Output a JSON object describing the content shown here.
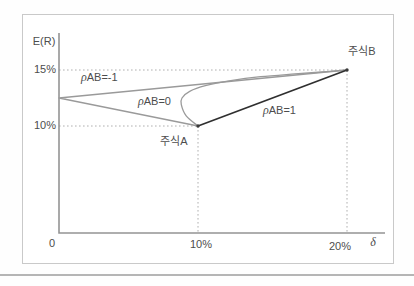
{
  "colors": {
    "axis": "#949494",
    "dotted": "#b0b0b0",
    "text": "#4d4d4d",
    "frame_border": "#c9c9c9",
    "divider": "#b5b5b5",
    "point": "#3a3a3a"
  },
  "chart_data": {
    "type": "line",
    "title": "",
    "xlabel": "δ",
    "ylabel": "E(R)",
    "xlim": [
      0,
      22
    ],
    "ylim": [
      0,
      17.5
    ],
    "grid": false,
    "x_ticks": [
      {
        "value": 0,
        "label": "0"
      },
      {
        "value": 10,
        "label": "10%"
      },
      {
        "value": 20,
        "label": "20%"
      }
    ],
    "y_ticks": [
      {
        "value": 10,
        "label": "10%"
      },
      {
        "value": 15,
        "label": "15%"
      }
    ],
    "points": {
      "stock_a": {
        "label": "주식A",
        "x": 10,
        "y": 10
      },
      "stock_b": {
        "label": "주식B",
        "x": 20,
        "y": 15
      },
      "zero_risk_vertex": {
        "x": 0,
        "y": 12.5
      }
    },
    "series": [
      {
        "name": "ρAB=-1",
        "label_parts": {
          "rho": "ρ",
          "text": "AB=-1"
        },
        "color": "#9a9a9a",
        "width": 1.3,
        "smooth": false,
        "points": [
          [
            10,
            10
          ],
          [
            0,
            12.5
          ],
          [
            20,
            15
          ]
        ]
      },
      {
        "name": "ρAB=0",
        "label_parts": {
          "rho": "ρ",
          "text": "AB=0"
        },
        "color": "#9a9a9a",
        "width": 1.3,
        "smooth": true,
        "points": [
          [
            10,
            10
          ],
          [
            9.15,
            10.9
          ],
          [
            8.8,
            11.9
          ],
          [
            8.85,
            12.5
          ],
          [
            9.4,
            13.1
          ],
          [
            10.5,
            13.6
          ],
          [
            12.2,
            14.05
          ],
          [
            14.2,
            14.4
          ],
          [
            16.5,
            14.65
          ],
          [
            18.3,
            14.82
          ],
          [
            20,
            15
          ]
        ]
      },
      {
        "name": "ρAB=1",
        "label_parts": {
          "rho": "ρ",
          "text": "AB=1"
        },
        "color": "#2f2f2f",
        "width": 1.7,
        "smooth": false,
        "points": [
          [
            10,
            10
          ],
          [
            20,
            15
          ]
        ]
      }
    ],
    "reference_lines": [
      {
        "type": "h",
        "y": 15,
        "x1": 0,
        "x2": 20
      },
      {
        "type": "h",
        "y": 10,
        "x1": 0,
        "x2": 10
      },
      {
        "type": "v",
        "x": 10,
        "y_from": 10
      },
      {
        "type": "v",
        "x": 20,
        "y_from": 15
      }
    ]
  }
}
